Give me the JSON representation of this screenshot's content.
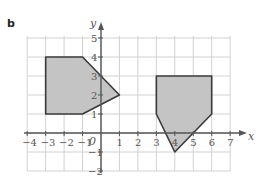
{
  "figure": {
    "label": "b",
    "axes": {
      "x_label": "x",
      "y_label": "y",
      "origin_label": "0",
      "x_ticks": [
        "−4",
        "−3",
        "−2",
        "−1",
        "1",
        "2",
        "3",
        "4",
        "5",
        "6",
        "7"
      ],
      "y_ticks": [
        "5",
        "4",
        "3",
        "2",
        "1",
        "−1",
        "−2"
      ],
      "x_range": [
        -4,
        7
      ],
      "y_range": [
        -2,
        5
      ],
      "grid": true
    },
    "shapes": [
      {
        "name": "pentagon-left",
        "vertices": [
          [
            -3,
            4
          ],
          [
            -1,
            4
          ],
          [
            1,
            2
          ],
          [
            -1,
            1
          ],
          [
            -3,
            1
          ]
        ]
      },
      {
        "name": "pentagon-right",
        "vertices": [
          [
            3,
            3
          ],
          [
            6,
            3
          ],
          [
            6,
            1
          ],
          [
            4,
            -1
          ],
          [
            3,
            1
          ]
        ]
      }
    ],
    "colors": {
      "fill": "#c4c4c4",
      "outline": "#3a3a3a",
      "grid": "#d2d2d2",
      "axis": "#555555"
    }
  }
}
